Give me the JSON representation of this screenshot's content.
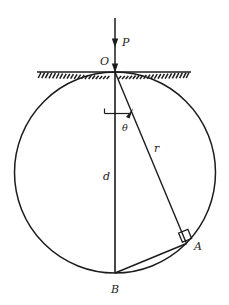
{
  "figure": {
    "background_color": "#ffffff",
    "stroke_color": "#1c1c1c",
    "labels": {
      "p": "P",
      "o": "O",
      "theta": "θ",
      "r": "r",
      "d": "d",
      "a": "A",
      "b": "B"
    },
    "geometry": {
      "circle": {
        "cx": 115,
        "cy": 172.5,
        "r": 100.5
      },
      "point_o": {
        "x": 115,
        "y": 72
      },
      "point_b": {
        "x": 115,
        "y": 273
      },
      "point_a": {
        "x": 186,
        "y": 243
      },
      "arrow_p": {
        "x": 115,
        "y_start": 18,
        "y_end": 72
      },
      "ground_line": {
        "x1": 38,
        "x2": 190,
        "y": 72
      },
      "angle_arc_label_pos": {
        "x": 120,
        "y": 127
      },
      "right_angle_marker": {
        "x": 186,
        "y": 243,
        "size": 11
      }
    },
    "elements": [
      "vertical-incident-ray-P",
      "hatched-surface-line",
      "circle",
      "diameter-d-from-O-to-B",
      "chord-r-from-O-to-A",
      "chord-from-B-to-A",
      "right-angle-marker-at-A",
      "angle-theta-marker-at-O"
    ]
  }
}
